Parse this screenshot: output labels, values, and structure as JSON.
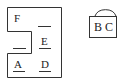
{
  "diagram": {
    "left_figure": {
      "labels": [
        {
          "id": "F",
          "text": "F",
          "x": 14,
          "y": 12,
          "underlined": false
        },
        {
          "id": "E",
          "text": "E",
          "x": 40,
          "y": 37,
          "underlined": true
        },
        {
          "id": "A",
          "text": "A",
          "x": 14,
          "y": 58,
          "underlined": true
        },
        {
          "id": "D",
          "text": "D",
          "x": 40,
          "y": 58,
          "underlined": true
        }
      ],
      "blanks": [
        {
          "id": "blank-right-top",
          "x": 38,
          "y": 26,
          "w": 13
        },
        {
          "id": "blank-left-mid",
          "x": 13,
          "y": 48,
          "w": 13
        }
      ]
    },
    "right_figure": {
      "label": "B C",
      "shape": "padlock"
    },
    "stroke_color": "#333333",
    "background": "#ffffff"
  }
}
